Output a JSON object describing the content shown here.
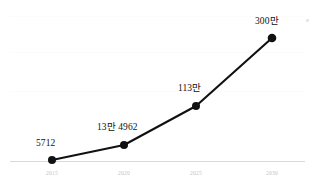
{
  "chart_data": {
    "type": "line",
    "title": "",
    "subtitle": "",
    "xlabel": "",
    "ylabel": "",
    "categories": [
      "2015",
      "2020",
      "2025",
      "2030"
    ],
    "x": [
      2015,
      2020,
      2025,
      2030
    ],
    "values": [
      5712,
      134962,
      1130000,
      3000000
    ],
    "point_labels": [
      "5712",
      "13만 4962",
      "113만",
      "300만"
    ],
    "tick_labels": [
      "2015",
      "2020",
      "2025",
      "2030"
    ],
    "legend": [],
    "legend_position": "none",
    "grid": true,
    "gridlines_y": 3,
    "xlim": [
      2013,
      2032
    ],
    "ylim": [
      0,
      3300000
    ],
    "series": [
      {
        "name": "",
        "values": [
          5712,
          134962,
          1130000,
          3000000
        ],
        "labels": [
          "5712",
          "13만 4962",
          "113만",
          "300만"
        ],
        "color": "#111111",
        "marker": "circle",
        "line_width": 2.1
      }
    ],
    "colors": {
      "line": "#111111",
      "marker": "#111111",
      "background": "#ffffff",
      "gridline": "#fbfbfc",
      "baseline": "#d9d9d9",
      "tick_text": "#c2c2c6",
      "label_text": "#111111"
    }
  },
  "points": [
    {
      "label": "5712",
      "tick": "2015",
      "cx": 52,
      "cy": 160,
      "label_x": 36,
      "label_y": 139
    },
    {
      "label": "13만 4962",
      "tick": "2020",
      "cx": 124,
      "cy": 145,
      "label_x": 97,
      "label_y": 123
    },
    {
      "label": "113만",
      "tick": "2025",
      "cx": 196,
      "cy": 106,
      "label_x": 178,
      "label_y": 84
    },
    {
      "label": "300만",
      "tick": "2030",
      "cx": 272,
      "cy": 38,
      "label_x": 255,
      "label_y": 17
    }
  ],
  "axis": {
    "baseline_y": 161,
    "baseline_x_start": 10,
    "baseline_x_end": 305,
    "tick_label_y": 171
  },
  "gridlines": [
    {
      "y": 16
    },
    {
      "y": 52
    },
    {
      "y": 91
    }
  ]
}
